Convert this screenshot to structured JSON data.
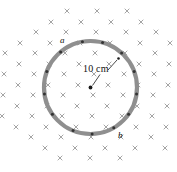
{
  "figure": {
    "background_color": "#ffffff",
    "width": 177,
    "height": 172
  },
  "field": {
    "symbol": "x",
    "symbol_name": "field-into-page-x",
    "description": "Uniform magnetic field into the page shown as a grid of x marks",
    "color": "#9a9a9a",
    "mark_size": 4.6,
    "rows": [
      {
        "y": 11,
        "xs": [
          67,
          97,
          127
        ]
      },
      {
        "y": 22,
        "xs": [
          51,
          81,
          111,
          141
        ]
      },
      {
        "y": 22.5,
        "xs": []
      },
      {
        "y": 32,
        "xs": [
          36,
          66,
          96,
          126,
          156
        ]
      },
      {
        "y": 43,
        "xs": [
          20,
          50,
          80,
          110,
          140,
          170
        ]
      },
      {
        "y": 53,
        "xs": [
          5,
          35,
          65,
          95,
          125,
          155
        ]
      },
      {
        "y": 64,
        "xs": [
          19,
          49,
          79,
          109,
          139,
          169
        ]
      },
      {
        "y": 74,
        "xs": [
          4,
          34,
          64,
          94,
          124,
          154
        ]
      },
      {
        "y": 85,
        "xs": [
          18,
          48,
          78,
          108,
          138,
          168
        ]
      },
      {
        "y": 95,
        "xs": [
          3,
          33,
          63,
          93,
          123,
          153
        ]
      },
      {
        "y": 106,
        "xs": [
          17,
          47,
          77,
          107,
          137,
          167
        ]
      },
      {
        "y": 116,
        "xs": [
          2,
          32,
          62,
          92,
          122,
          152
        ]
      },
      {
        "y": 127,
        "xs": [
          16,
          46,
          76,
          106,
          136,
          166
        ]
      },
      {
        "y": 137,
        "xs": [
          31,
          61,
          91,
          121,
          151
        ]
      },
      {
        "y": 148,
        "xs": [
          45,
          75,
          105,
          135,
          165
        ]
      },
      {
        "y": 158,
        "xs": [
          60,
          90,
          120
        ]
      }
    ]
  },
  "loop": {
    "name": "circular-loop",
    "center": {
      "x": 90.5,
      "y": 87.5
    },
    "radius": 46.5,
    "ring_color": "#8f8f8f",
    "ring_thickness": 4.2,
    "specks": [
      {
        "angle_deg": 130
      },
      {
        "angle_deg": 100
      },
      {
        "angle_deg": 75
      },
      {
        "angle_deg": 48
      },
      {
        "angle_deg": 20
      },
      {
        "angle_deg": 352
      },
      {
        "angle_deg": 325
      },
      {
        "angle_deg": 300
      },
      {
        "angle_deg": 272
      },
      {
        "angle_deg": 248
      },
      {
        "angle_deg": 215
      },
      {
        "angle_deg": 188
      },
      {
        "angle_deg": 160
      }
    ]
  },
  "center_marker": {
    "name": "loop-center-dot",
    "x": 90.5,
    "y": 87.5,
    "radius": 1.9,
    "color": "#1a1a1a"
  },
  "point_marker": {
    "name": "upper-right-point-dot",
    "x": 118.5,
    "y": 58.5,
    "radius": 1.3,
    "color": "#1a1a1a"
  },
  "leaders": [
    {
      "name": "radius-leader-line",
      "from": {
        "x": 92.5,
        "y": 85.5
      },
      "to": {
        "x": 100.0,
        "y": 74.5
      }
    },
    {
      "name": "point-leader-line",
      "from": {
        "x": 117.0,
        "y": 60.0
      },
      "to": {
        "x": 108.0,
        "y": 70.0
      }
    }
  ],
  "labels": {
    "point_a": "a",
    "point_b": "b",
    "radius": "10 cm"
  },
  "colors": {
    "field_mark": "#9a9a9a",
    "ring": "#8f8f8f",
    "speck": "#333333",
    "text": "#111111",
    "background": "#ffffff"
  }
}
